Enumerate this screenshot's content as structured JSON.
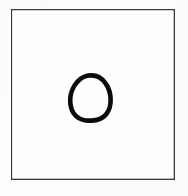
{
  "document": {
    "title": "Hand-drawn closed loop figure",
    "media": "scanned line drawing",
    "canvas": {
      "width": 188,
      "height": 196
    },
    "background_color": "#fdfdfd"
  },
  "frame": {
    "name": "rectangular border",
    "shape": "rectangle",
    "stroke_color": "#3a3a3c",
    "stroke_width_px": 1,
    "fill_color": "#fefefe",
    "left_px": 11,
    "top_px": 9,
    "width_px": 164,
    "height_px": 171
  },
  "figure": {
    "name": "rounded-triangle loop",
    "stroke_color": "#0b0b0b",
    "stroke_width_px": 4.6,
    "fill": "none",
    "closed": true,
    "bounds": {
      "x_min": 70,
      "y_min": 74,
      "x_max": 111,
      "y_max": 121
    },
    "center": {
      "x": 90,
      "y": 98
    },
    "width_px": 41,
    "height_px": 47,
    "outline_path": "M 90.2 75.4 C 96.6 75.0 102.4 78.6 105.8 83.6 C 108.8 88.0 110.4 93.2 110.6 98.6 C 110.9 104.4 109.6 110.0 106.2 114.2 C 102.8 118.4 97.2 120.4 91.4 120.6 C 85.6 120.9 79.8 119.6 75.8 115.8 C 72.0 112.2 70.4 106.8 70.2 101.4 C 70.0 95.8 71.6 90.2 74.6 85.4 C 77.6 80.6 82.2 76.8 87.0 75.7 Z",
    "inner_highlight_path": "M 90.0 80.2 C 95.2 80.0 99.8 83.2 102.4 87.6 C 104.8 91.6 105.8 96.2 105.8 100.8 C 105.9 105.4 104.6 110.0 101.6 113.2 C 98.6 116.4 93.8 117.6 89.2 117.6 C 84.4 117.6 79.8 116.2 76.8 113.0 C 73.8 109.8 72.8 105.0 73.0 100.4 C 73.2 95.6 74.8 90.8 77.4 87.0 C 80.0 83.2 84.4 80.6 88.4 80.3 Z"
  },
  "artifacts": {
    "smudge_note": "faint light-gray scanner smudges across lower-left and lower-center of the sheet",
    "faint_mark": {
      "x": 120,
      "y": 80,
      "description": "very faint light speck right of the figure"
    }
  }
}
